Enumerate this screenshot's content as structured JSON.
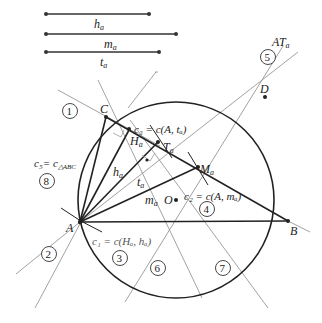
{
  "segments": {
    "h_a": {
      "label": "h",
      "sub": "a"
    },
    "m_a": {
      "label": "m",
      "sub": "a"
    },
    "t_a": {
      "label": "t",
      "sub": "a"
    }
  },
  "points": {
    "A": "A",
    "B": "B",
    "C": "C",
    "D": "D",
    "O": "O",
    "H_a": {
      "label": "H",
      "sub": "a"
    },
    "T_a": {
      "label": "T",
      "sub": "a"
    },
    "M_a": {
      "label": "M",
      "sub": "a"
    }
  },
  "annotations": {
    "c1": "c₁ = c(Hₐ, hₐ)",
    "c2": "c₂ = c(A, mₐ)",
    "c3": "c₃ = c(A, tₐ)",
    "c5": "c₅= c",
    "c5_sub": "△ABC",
    "AT": "AT",
    "AT_sub": "a",
    "inner_h": "h",
    "inner_h_sub": "a",
    "inner_t": "t",
    "inner_t_sub": "a",
    "inner_m": "m",
    "inner_m_sub": "a"
  },
  "steps": [
    "1",
    "2",
    "3",
    "4",
    "5",
    "6",
    "7",
    "8"
  ],
  "colors": {
    "thick": "#222222",
    "thin": "#888888",
    "point": "#222222"
  }
}
